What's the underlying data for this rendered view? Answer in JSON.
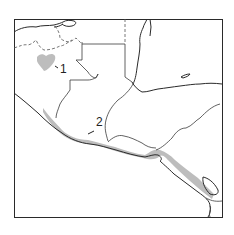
{
  "map": {
    "title": "",
    "labels": [
      {
        "id": "1",
        "text": "1",
        "x": 60,
        "y": 73
      },
      {
        "id": "2",
        "text": "2",
        "x": 96,
        "y": 126
      }
    ],
    "legend": [],
    "colors": {
      "range_fill": "#bdbdbd",
      "line": "#2a2a2a",
      "background": "#ffffff"
    }
  }
}
